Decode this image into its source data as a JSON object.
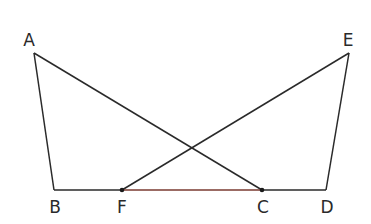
{
  "figure": {
    "points": {
      "A": {
        "label": "A",
        "x": 34,
        "y": 53
      },
      "B": {
        "label": "B",
        "x": 54,
        "y": 190
      },
      "F": {
        "label": "F",
        "x": 122,
        "y": 190
      },
      "C": {
        "label": "C",
        "x": 262,
        "y": 190
      },
      "D": {
        "label": "D",
        "x": 326,
        "y": 190
      },
      "E": {
        "label": "E",
        "x": 349,
        "y": 53
      }
    },
    "segments": [
      "AB",
      "AC",
      "EF",
      "ED",
      "BD"
    ],
    "highlighted_segment": "FC",
    "colors": {
      "line": "#2a2a2a",
      "highlight": "#7a3a30"
    }
  }
}
